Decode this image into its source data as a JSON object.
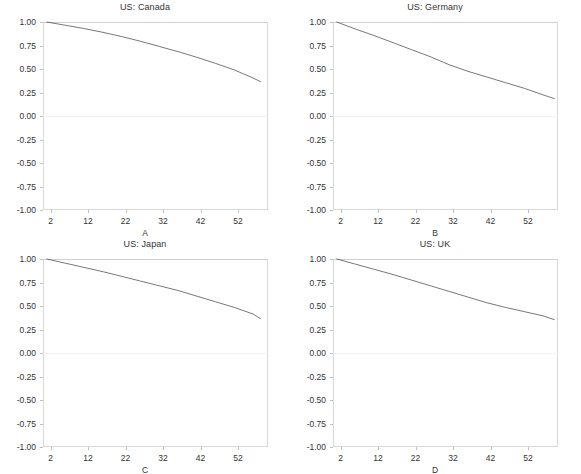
{
  "figure": {
    "background_color": "#ffffff",
    "line_color": "#4a4a4a",
    "frame_color": "#d8d8d8",
    "grid": "zero-line-only",
    "layout": "2x2 grid of small-multiple line panels"
  },
  "chart_data": [
    {
      "type": "line",
      "title": "US: Canada",
      "xlabel": "A",
      "ylabel": "",
      "xlim": [
        0,
        60
      ],
      "ylim": [
        -1.0,
        1.0
      ],
      "xticks": [
        2,
        12,
        22,
        32,
        42,
        52
      ],
      "yticks": [
        1.0,
        0.75,
        0.5,
        0.25,
        0.0,
        -0.25,
        -0.5,
        -0.75,
        -1.0
      ],
      "ytick_labels": [
        "1.00",
        "0.75",
        "0.50",
        "0.25",
        "0.00",
        "-0.25",
        "-0.50",
        "-0.75",
        "-1.00"
      ],
      "grid": false,
      "legend": "none",
      "series": [
        {
          "name": "US: Canada",
          "x": [
            1,
            6,
            11,
            16,
            21,
            26,
            31,
            36,
            41,
            46,
            51,
            56,
            58
          ],
          "values": [
            1.0,
            0.965,
            0.93,
            0.89,
            0.845,
            0.795,
            0.74,
            0.685,
            0.625,
            0.56,
            0.49,
            0.405,
            0.365
          ]
        }
      ]
    },
    {
      "type": "line",
      "title": "US: Germany",
      "xlabel": "B",
      "ylabel": "",
      "xlim": [
        0,
        60
      ],
      "ylim": [
        -1.0,
        1.0
      ],
      "xticks": [
        2,
        12,
        22,
        32,
        42,
        52
      ],
      "yticks": [
        1.0,
        0.75,
        0.5,
        0.25,
        0.0,
        -0.25,
        -0.5,
        -0.75,
        -1.0
      ],
      "ytick_labels": [
        "1.00",
        "0.75",
        "0.50",
        "0.25",
        "0.00",
        "-0.25",
        "-0.50",
        "-0.75",
        "-1.00"
      ],
      "grid": false,
      "legend": "none",
      "series": [
        {
          "name": "US: Germany",
          "x": [
            1,
            6,
            11,
            16,
            21,
            26,
            31,
            36,
            41,
            46,
            51,
            56,
            59
          ],
          "values": [
            1.0,
            0.925,
            0.855,
            0.78,
            0.705,
            0.63,
            0.545,
            0.475,
            0.415,
            0.355,
            0.295,
            0.225,
            0.185
          ]
        }
      ]
    },
    {
      "type": "line",
      "title": "US: Japan",
      "xlabel": "C",
      "ylabel": "",
      "xlim": [
        0,
        60
      ],
      "ylim": [
        -1.0,
        1.0
      ],
      "xticks": [
        2,
        12,
        22,
        32,
        42,
        52
      ],
      "yticks": [
        1.0,
        0.75,
        0.5,
        0.25,
        0.0,
        -0.25,
        -0.5,
        -0.75,
        -1.0
      ],
      "ytick_labels": [
        "1.00",
        "0.75",
        "0.50",
        "0.25",
        "0.00",
        "-0.25",
        "-0.50",
        "-0.75",
        "-1.00"
      ],
      "grid": false,
      "legend": "none",
      "series": [
        {
          "name": "US: Japan",
          "x": [
            1,
            6,
            11,
            16,
            21,
            26,
            31,
            36,
            41,
            46,
            51,
            56,
            58
          ],
          "values": [
            1.0,
            0.955,
            0.91,
            0.865,
            0.815,
            0.765,
            0.715,
            0.665,
            0.605,
            0.545,
            0.485,
            0.415,
            0.365
          ]
        }
      ]
    },
    {
      "type": "line",
      "title": "US: UK",
      "xlabel": "D",
      "ylabel": "",
      "xlim": [
        0,
        60
      ],
      "ylim": [
        -1.0,
        1.0
      ],
      "xticks": [
        2,
        12,
        22,
        32,
        42,
        52
      ],
      "yticks": [
        1.0,
        0.75,
        0.5,
        0.25,
        0.0,
        -0.25,
        -0.5,
        -0.75,
        -1.0
      ],
      "ytick_labels": [
        "1.00",
        "0.75",
        "0.50",
        "0.25",
        "0.00",
        "-0.25",
        "-0.50",
        "-0.75",
        "-1.00"
      ],
      "grid": false,
      "legend": "none",
      "series": [
        {
          "name": "US: UK",
          "x": [
            1,
            6,
            11,
            16,
            21,
            26,
            31,
            36,
            41,
            46,
            51,
            56,
            59
          ],
          "values": [
            1.0,
            0.945,
            0.89,
            0.835,
            0.775,
            0.715,
            0.655,
            0.595,
            0.535,
            0.485,
            0.44,
            0.395,
            0.355
          ]
        }
      ]
    }
  ]
}
